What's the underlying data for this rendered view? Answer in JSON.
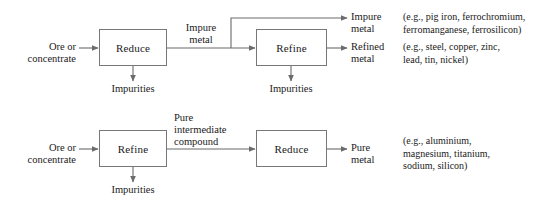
{
  "diagram": {
    "type": "process-flow",
    "title": "",
    "rows": [
      {
        "id": "top-route",
        "input_label": "Ore or\nconcentrate",
        "stages": [
          {
            "id": "top-reduce",
            "label": "Reduce"
          },
          {
            "id": "top-refine",
            "label": "Refine"
          }
        ],
        "intermediate_label": "Impure\nmetal",
        "waste_labels": [
          {
            "id": "top-impurities-1",
            "label": "Impurities"
          },
          {
            "id": "top-impurities-2",
            "label": "Impurities"
          }
        ],
        "outputs": [
          {
            "id": "impure-metal-output",
            "label": "Impure\nmetal",
            "examples": "(e.g., pig iron, ferrochromium,\nferromanganese, ferrosilicon)"
          },
          {
            "id": "refined-metal-output",
            "label": "Refined\nmetal",
            "examples": "(e.g., steel, copper, zinc,\nlead, tin, nickel)"
          }
        ]
      },
      {
        "id": "bottom-route",
        "input_label": "Ore or\nconcentrate",
        "stages": [
          {
            "id": "bottom-refine",
            "label": "Refine"
          },
          {
            "id": "bottom-reduce",
            "label": "Reduce"
          }
        ],
        "intermediate_label": "Pure\nintermediate\ncompound",
        "waste_labels": [
          {
            "id": "bottom-impurities-1",
            "label": "Impurities"
          }
        ],
        "outputs": [
          {
            "id": "pure-metal-output",
            "label": "Pure\nmetal",
            "examples": "(e.g., aluminium,\nmagnesium, titanium,\nsodium, silicon)"
          }
        ]
      }
    ],
    "colors": {
      "line": "#6b6b6b",
      "box_border": "#777777",
      "text": "#1a1a1a",
      "background": "#ffffff"
    }
  }
}
